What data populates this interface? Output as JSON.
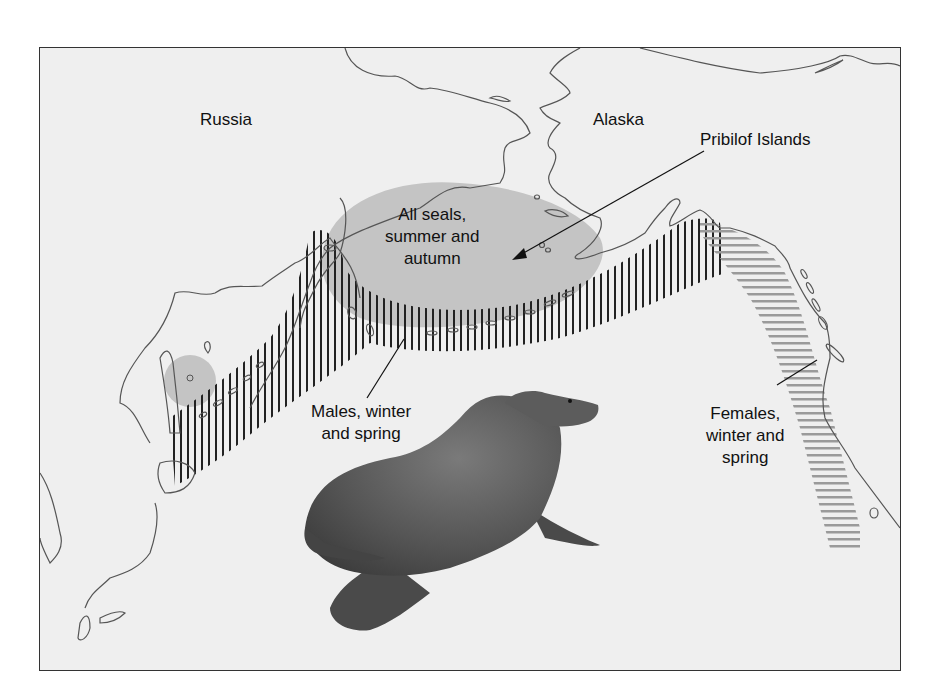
{
  "figure": {
    "type": "range map"
  },
  "regions": {
    "russia": "Russia",
    "alaska": "Alaska"
  },
  "annotations": {
    "pribilof": "Pribilof Islands",
    "all_seals_line1": "All seals,",
    "all_seals_line2": "summer and",
    "all_seals_line3": "autumn",
    "males_line1": "Males, winter",
    "males_line2": "and spring",
    "females_line1": "Females,",
    "females_line2": "winter and",
    "females_line3": "spring"
  },
  "legend_styles": {
    "all_seals_summer_autumn": {
      "pattern": "solid gray fill",
      "color": "#c4c4c4"
    },
    "males_winter_spring": {
      "pattern": "vertical black hatching",
      "color": "#222222"
    },
    "females_winter_spring": {
      "pattern": "horizontal gray hatching",
      "color": "#9a9a9a"
    }
  },
  "colors": {
    "background": "#efefef",
    "coastline": "#555555",
    "frame": "#333333",
    "seal_body": "#5a5a5a"
  }
}
